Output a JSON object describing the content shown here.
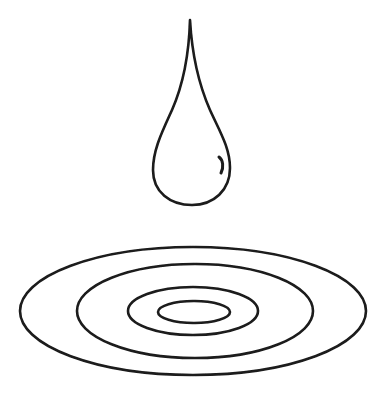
{
  "illustration": {
    "title": "Water drop and ripples",
    "stroke_color": "#1a1a1a",
    "background_color": "#ffffff",
    "drop": {
      "tip": [
        190,
        20
      ],
      "bulb_center": [
        192,
        168
      ],
      "bulb_width": 77,
      "bottom_y": 205,
      "highlight": "glint-mark"
    },
    "ripples": [
      {
        "name": "outer",
        "cx": 193,
        "cy": 311,
        "rx": 173,
        "ry": 64
      },
      {
        "name": "second",
        "cx": 195,
        "cy": 311,
        "rx": 118,
        "ry": 47
      },
      {
        "name": "third",
        "cx": 193,
        "cy": 311,
        "rx": 65,
        "ry": 24
      },
      {
        "name": "inner",
        "cx": 194,
        "cy": 312,
        "rx": 36,
        "ry": 11
      }
    ]
  }
}
